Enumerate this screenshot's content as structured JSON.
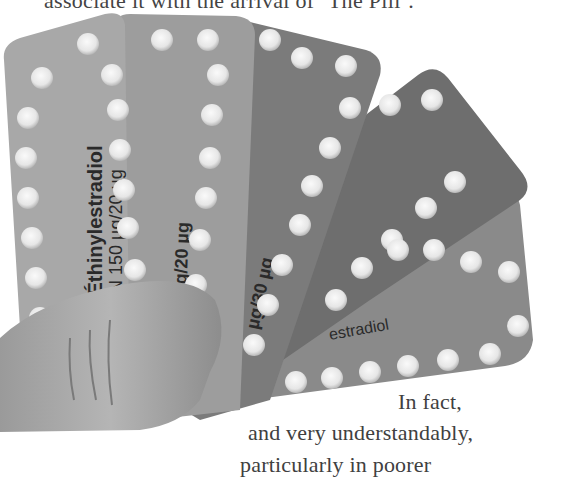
{
  "page": {
    "top_text": "associate it with the arrival of ‘The Pill’.",
    "wrapped_text": [
      "In fact,",
      "and very understandably,",
      "particularly in poorer"
    ]
  },
  "figure": {
    "pack_labels": [
      "sogestrel/Éthinylestradiol",
      "150 µg/20 µg",
      "Ethinylestradiol 150 µg/20 µg",
      "µg/30 µg",
      "Désogestrel Biogaran 150",
      "estradiol",
      "µg"
    ],
    "day_labels": [
      "lu.",
      "ma.",
      "me.",
      "je.",
      "ve.",
      "sa.",
      "di."
    ]
  }
}
